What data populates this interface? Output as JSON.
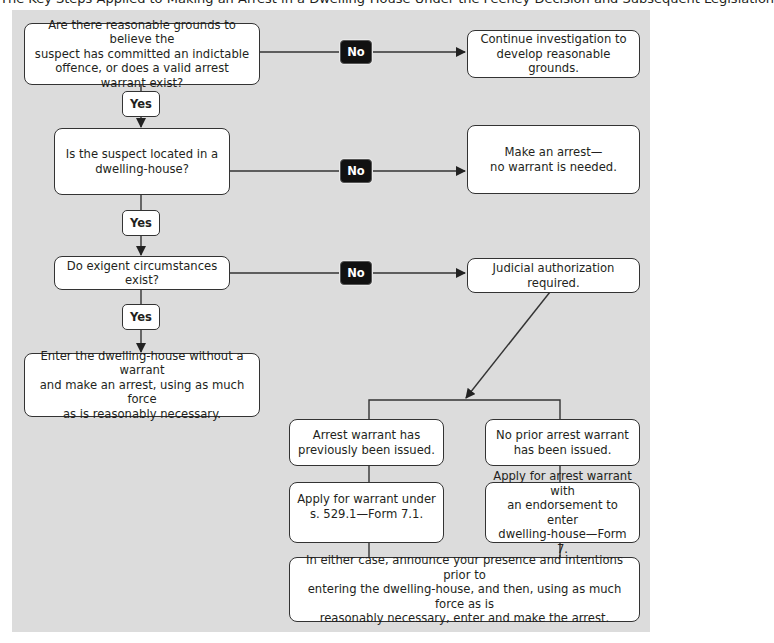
{
  "header": {
    "cut_off_caption": "The Key Steps Applied to Making an Arrest in a Dwelling-House Under the Feeney Decision and Subsequent Legislation"
  },
  "flowchart": {
    "question1": "Are there reasonable grounds to believe the\nsuspect has committed an indictable\noffence, or does a valid arrest warrant exist?",
    "question2": "Is the suspect located in a\ndwelling-house?",
    "question3": "Do exigent circumstances exist?",
    "yes_labels": [
      "Yes",
      "Yes",
      "Yes"
    ],
    "no_labels": [
      "No",
      "No",
      "No"
    ],
    "outcome_no1": "Continue investigation to\ndevelop reasonable grounds.",
    "outcome_no2": "Make an arrest—\nno warrant is needed.",
    "outcome_no3": "Judicial authorization required.",
    "outcome_yes3": "Enter the dwelling-house without a warrant\nand make an arrest, using as much force\nas is reasonably necessary.",
    "branch_left": "Arrest warrant has\npreviously been issued.",
    "branch_right": "No prior arrest warrant\nhas been issued.",
    "apply_left": "Apply for warrant under\ns. 529.1—Form 7.1.",
    "apply_right": "Apply for arrest warrant with\nan endorsement to enter\ndwelling-house—Form 7.",
    "final": "In either case, announce your presence and intentions prior to\nentering the dwelling-house, and then, using as much force as is\nreasonably necessary, enter and make the arrest."
  },
  "colors": {
    "panel_background": "#dcdcdc",
    "box_fill": "#ffffff",
    "no_badge_fill": "#111111",
    "line": "#333333"
  }
}
